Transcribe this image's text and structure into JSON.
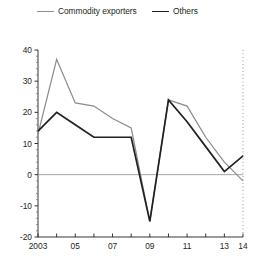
{
  "legend": {
    "items": [
      {
        "label": "Commodity exporters",
        "color": "#8c8c8c",
        "key": "commodity"
      },
      {
        "label": "Others",
        "color": "#231f20",
        "key": "others"
      }
    ]
  },
  "axes": {
    "y_ticks": [
      "40",
      "30",
      "20",
      "10",
      "0",
      "-10",
      "-20"
    ],
    "x_ticks": [
      "2003",
      "05",
      "07",
      "09",
      "11",
      "13",
      "14"
    ]
  },
  "chart_data": {
    "type": "line",
    "title": "",
    "subtitle": "",
    "xlabel": "",
    "ylabel": "",
    "xlim": [
      2003,
      2014
    ],
    "ylim": [
      -20,
      40
    ],
    "grid": false,
    "legend_position": "top",
    "x": [
      2003,
      2004,
      2005,
      2006,
      2007,
      2008,
      2009,
      2010,
      2011,
      2012,
      2013,
      2014
    ],
    "x_tick_values": [
      2003,
      2005,
      2007,
      2009,
      2011,
      2013,
      2014
    ],
    "x_tick_labels": [
      "2003",
      "05",
      "07",
      "09",
      "11",
      "13",
      "14"
    ],
    "y_tick_values": [
      40,
      30,
      20,
      10,
      0,
      -10,
      -20
    ],
    "y_tick_labels": [
      "40",
      "30",
      "20",
      "10",
      "0",
      "-10",
      "-20"
    ],
    "zero_line": 0,
    "series": [
      {
        "name": "Commodity exporters",
        "color": "#8c8c8c",
        "values": [
          13,
          37,
          23,
          22,
          18,
          15,
          -15,
          24,
          22,
          12,
          4,
          -2
        ]
      },
      {
        "name": "Others",
        "color": "#231f20",
        "values": [
          14,
          20,
          16,
          12,
          12,
          12,
          -15,
          24,
          17,
          9,
          1,
          6
        ]
      }
    ]
  }
}
